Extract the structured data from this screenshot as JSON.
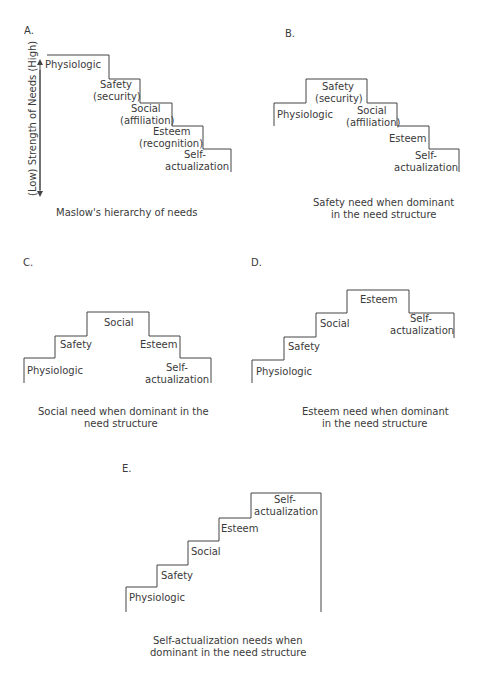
{
  "panels": {
    "A": {
      "letter": "A.",
      "axis_label": "(Low) Strength of Needs (High)",
      "steps": {
        "physiologic": "Physiologic",
        "safety_1": "Safety",
        "safety_2": "(security)",
        "social_1": "Social",
        "social_2": "(affiliation)",
        "esteem_1": "Esteem",
        "esteem_2": "(recognition)",
        "self_1": "Self-",
        "self_2": "actualization"
      },
      "caption": [
        "Maslow's hierarchy of needs"
      ]
    },
    "B": {
      "letter": "B.",
      "steps": {
        "safety_1": "Safety",
        "safety_2": "(security)",
        "physiologic": "Physiologic",
        "social_1": "Social",
        "social_2": "(affiliation)",
        "esteem": "Esteem",
        "self_1": "Self-",
        "self_2": "actualization"
      },
      "caption": [
        "Safety need when dominant",
        "in the need structure"
      ]
    },
    "C": {
      "letter": "C.",
      "steps": {
        "social": "Social",
        "safety": "Safety",
        "esteem": "Esteem",
        "physiologic": "Physiologic",
        "self_1": "Self-",
        "self_2": "actualization"
      },
      "caption": [
        "Social need when dominant in the",
        "need structure"
      ]
    },
    "D": {
      "letter": "D.",
      "steps": {
        "esteem": "Esteem",
        "social": "Social",
        "self_1": "Self-",
        "self_2": "actualization",
        "safety": "Safety",
        "physiologic": "Physiologic"
      },
      "caption": [
        "Esteem need when dominant",
        "in the need structure"
      ]
    },
    "E": {
      "letter": "E.",
      "steps": {
        "self_1": "Self-",
        "self_2": "actualization",
        "esteem": "Esteem",
        "social": "Social",
        "safety": "Safety",
        "physiologic": "Physiologic"
      },
      "caption": [
        "Self-actualization needs when",
        "dominant in the need structure"
      ]
    }
  },
  "colors": {
    "line": "#444444",
    "text": "#3a3a3a",
    "background": "#ffffff"
  }
}
